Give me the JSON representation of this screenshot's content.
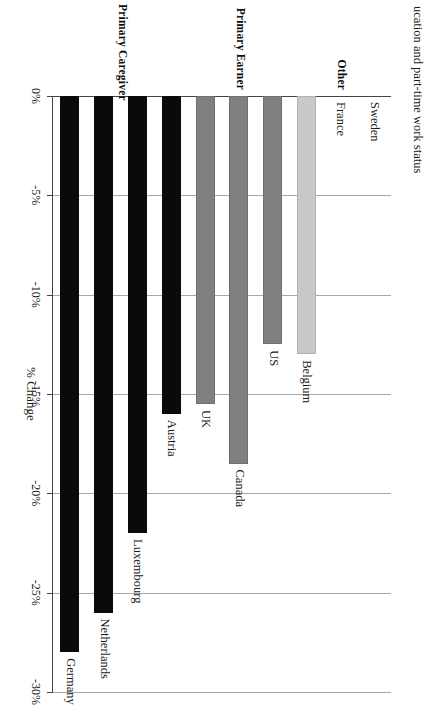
{
  "page": {
    "running_text": "ucation and part-time work status"
  },
  "chart_data": {
    "type": "bar",
    "orientation": "horizontal",
    "title": "",
    "xlabel": "% Change",
    "ylabel": "",
    "xlim": [
      0,
      -30
    ],
    "grid": true,
    "legend_position": "none",
    "tick_labels": [
      "0%",
      "-5%",
      "-10%",
      "-15%",
      "-20%",
      "-25%",
      "-30%"
    ],
    "tick_values": [
      0,
      -5,
      -10,
      -15,
      -20,
      -25,
      -30
    ],
    "categories": [
      "Germany",
      "Netherlands",
      "Luxembourg",
      "Austria",
      "UK",
      "Canada",
      "US",
      "Belgium",
      "France",
      "Sweden"
    ],
    "values": [
      -28.0,
      -26.0,
      -22.0,
      -16.0,
      -15.5,
      -18.5,
      -12.5,
      -13.0,
      0,
      0
    ],
    "groups": [
      {
        "label": "Primary Caregiver",
        "color": "#0a0a0a",
        "style": "black",
        "categories": [
          "Germany",
          "Netherlands",
          "Luxembourg",
          "Austria"
        ]
      },
      {
        "label": "Primary Earner",
        "color": "#808080",
        "style": "dark",
        "categories": [
          "UK",
          "Canada",
          "US"
        ]
      },
      {
        "label": "Other",
        "color": "#c9c9c9",
        "style": "light",
        "categories": [
          "Belgium",
          "France",
          "Sweden"
        ]
      }
    ],
    "bars": [
      {
        "label": "Germany",
        "value": -28.0,
        "style": "black"
      },
      {
        "label": "Netherlands",
        "value": -26.0,
        "style": "black"
      },
      {
        "label": "Luxembourg",
        "value": -22.0,
        "style": "black"
      },
      {
        "label": "Austria",
        "value": -16.0,
        "style": "black"
      },
      {
        "label": "UK",
        "value": -15.5,
        "style": "dark"
      },
      {
        "label": "Canada",
        "value": -18.5,
        "style": "dark"
      },
      {
        "label": "US",
        "value": -12.5,
        "style": "dark"
      },
      {
        "label": "Belgium",
        "value": -13.0,
        "style": "light"
      },
      {
        "label": "France",
        "value": 0,
        "style": "light"
      },
      {
        "label": "Sweden",
        "value": 0,
        "style": "light"
      }
    ]
  }
}
